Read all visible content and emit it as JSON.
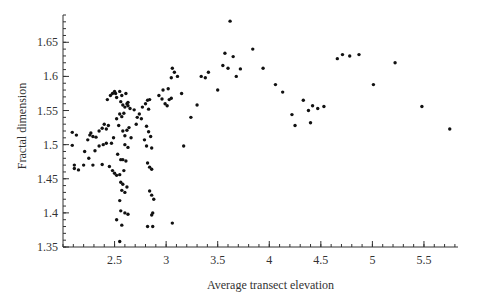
{
  "chart_data": {
    "type": "scatter",
    "title": "",
    "xlabel": "Average transect elevation",
    "ylabel": "Fractal dimension",
    "xlim": [
      2.0,
      5.83
    ],
    "ylim": [
      1.35,
      1.69
    ],
    "grid": false,
    "legend": "none",
    "x_ticks": [
      2.5,
      3,
      3.5,
      4,
      4.5,
      5,
      5.5
    ],
    "x_tick_labels": [
      "2.5",
      "3",
      "3.5",
      "4",
      "4.5",
      "5",
      "5.5"
    ],
    "x_minor_step": 0.1,
    "y_ticks": [
      1.35,
      1.4,
      1.45,
      1.5,
      1.55,
      1.6,
      1.65
    ],
    "y_tick_labels": [
      "1.35",
      "1.4",
      "1.45",
      "1.5",
      "1.55",
      "1.6",
      "1.65"
    ],
    "y_minor_step": 0.01,
    "points": [
      [
        2.09,
        1.518
      ],
      [
        2.13,
        1.514
      ],
      [
        2.09,
        1.499
      ],
      [
        2.11,
        1.47
      ],
      [
        2.11,
        1.465
      ],
      [
        2.15,
        1.463
      ],
      [
        2.24,
        1.507
      ],
      [
        2.26,
        1.514
      ],
      [
        2.27,
        1.517
      ],
      [
        2.29,
        1.512
      ],
      [
        2.32,
        1.511
      ],
      [
        2.35,
        1.52
      ],
      [
        2.38,
        1.524
      ],
      [
        2.4,
        1.53
      ],
      [
        2.42,
        1.523
      ],
      [
        2.44,
        1.528
      ],
      [
        2.21,
        1.49
      ],
      [
        2.25,
        1.48
      ],
      [
        2.31,
        1.491
      ],
      [
        2.35,
        1.498
      ],
      [
        2.39,
        1.5
      ],
      [
        2.42,
        1.502
      ],
      [
        2.47,
        1.502
      ],
      [
        2.49,
        1.51
      ],
      [
        2.2,
        1.47
      ],
      [
        2.29,
        1.47
      ],
      [
        2.38,
        1.471
      ],
      [
        2.45,
        1.468
      ],
      [
        2.48,
        1.462
      ],
      [
        2.5,
        1.458
      ],
      [
        2.52,
        1.455
      ],
      [
        2.43,
        1.566
      ],
      [
        2.46,
        1.572
      ],
      [
        2.48,
        1.575
      ],
      [
        2.5,
        1.578
      ],
      [
        2.52,
        1.569
      ],
      [
        2.55,
        1.578
      ],
      [
        2.56,
        1.563
      ],
      [
        2.58,
        1.558
      ],
      [
        2.6,
        1.555
      ],
      [
        2.62,
        1.56
      ],
      [
        2.63,
        1.557
      ],
      [
        2.65,
        1.553
      ],
      [
        2.51,
        1.575
      ],
      [
        2.57,
        1.572
      ],
      [
        2.61,
        1.575
      ],
      [
        2.63,
        1.562
      ],
      [
        2.52,
        1.538
      ],
      [
        2.55,
        1.545
      ],
      [
        2.57,
        1.541
      ],
      [
        2.59,
        1.546
      ],
      [
        2.54,
        1.528
      ],
      [
        2.58,
        1.52
      ],
      [
        2.6,
        1.513
      ],
      [
        2.62,
        1.521
      ],
      [
        2.64,
        1.525
      ],
      [
        2.66,
        1.51
      ],
      [
        2.6,
        1.5
      ],
      [
        2.63,
        1.496
      ],
      [
        2.53,
        1.486
      ],
      [
        2.56,
        1.478
      ],
      [
        2.58,
        1.478
      ],
      [
        2.61,
        1.476
      ],
      [
        2.59,
        1.462
      ],
      [
        2.55,
        1.456
      ],
      [
        2.56,
        1.445
      ],
      [
        2.58,
        1.442
      ],
      [
        2.62,
        1.438
      ],
      [
        2.57,
        1.433
      ],
      [
        2.6,
        1.43
      ],
      [
        2.55,
        1.418
      ],
      [
        2.56,
        1.403
      ],
      [
        2.6,
        1.4
      ],
      [
        2.63,
        1.398
      ],
      [
        2.52,
        1.39
      ],
      [
        2.57,
        1.382
      ],
      [
        2.55,
        1.358
      ],
      [
        2.69,
        1.551
      ],
      [
        2.72,
        1.54
      ],
      [
        2.74,
        1.545
      ],
      [
        2.76,
        1.538
      ],
      [
        2.71,
        1.53
      ],
      [
        2.77,
        1.555
      ],
      [
        2.8,
        1.56
      ],
      [
        2.82,
        1.565
      ],
      [
        2.84,
        1.566
      ],
      [
        2.83,
        1.552
      ],
      [
        2.81,
        1.527
      ],
      [
        2.83,
        1.519
      ],
      [
        2.85,
        1.512
      ],
      [
        2.79,
        1.507
      ],
      [
        2.81,
        1.498
      ],
      [
        2.86,
        1.495
      ],
      [
        2.82,
        1.473
      ],
      [
        2.84,
        1.467
      ],
      [
        2.86,
        1.464
      ],
      [
        2.84,
        1.432
      ],
      [
        2.86,
        1.426
      ],
      [
        2.88,
        1.42
      ],
      [
        2.87,
        1.4
      ],
      [
        2.86,
        1.397
      ],
      [
        2.82,
        1.38
      ],
      [
        2.87,
        1.38
      ],
      [
        2.93,
        1.572
      ],
      [
        2.96,
        1.567
      ],
      [
        2.99,
        1.56
      ],
      [
        3.01,
        1.557
      ],
      [
        3.03,
        1.566
      ],
      [
        3.05,
        1.568
      ],
      [
        2.97,
        1.58
      ],
      [
        3.02,
        1.582
      ],
      [
        3.05,
        1.598
      ],
      [
        3.08,
        1.606
      ],
      [
        3.06,
        1.612
      ],
      [
        3.11,
        1.6
      ],
      [
        3.15,
        1.575
      ],
      [
        3.17,
        1.498
      ],
      [
        3.06,
        1.385
      ],
      [
        3.24,
        1.54
      ],
      [
        3.3,
        1.558
      ],
      [
        3.34,
        1.6
      ],
      [
        3.38,
        1.598
      ],
      [
        3.41,
        1.606
      ],
      [
        3.5,
        1.58
      ],
      [
        3.55,
        1.616
      ],
      [
        3.57,
        1.634
      ],
      [
        3.6,
        1.612
      ],
      [
        3.62,
        1.681
      ],
      [
        3.65,
        1.629
      ],
      [
        3.68,
        1.6
      ],
      [
        3.72,
        1.611
      ],
      [
        3.84,
        1.64
      ],
      [
        3.94,
        1.612
      ],
      [
        4.06,
        1.588
      ],
      [
        4.13,
        1.577
      ],
      [
        4.22,
        1.544
      ],
      [
        4.25,
        1.528
      ],
      [
        4.33,
        1.565
      ],
      [
        4.38,
        1.55
      ],
      [
        4.4,
        1.532
      ],
      [
        4.42,
        1.557
      ],
      [
        4.47,
        1.553
      ],
      [
        4.53,
        1.556
      ],
      [
        4.66,
        1.626
      ],
      [
        4.71,
        1.632
      ],
      [
        4.78,
        1.63
      ],
      [
        4.87,
        1.632
      ],
      [
        5.01,
        1.588
      ],
      [
        5.22,
        1.62
      ],
      [
        5.48,
        1.556
      ],
      [
        5.75,
        1.523
      ]
    ]
  }
}
